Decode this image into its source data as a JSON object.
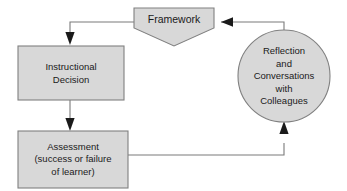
{
  "diagram": {
    "type": "flowchart-cycle",
    "canvas": {
      "width": 347,
      "height": 191
    },
    "style": {
      "node_fill": "#d8d8d8",
      "node_stroke": "#808080",
      "connector_stroke": "#7a7a7a",
      "text_color": "#1a1a1a",
      "background": "#ffffff"
    },
    "nodes": [
      {
        "id": "framework",
        "shape": "pentagon-banner",
        "lines": [
          "Framework"
        ],
        "x": 134,
        "y": 8,
        "width": 80,
        "height": 38
      },
      {
        "id": "instructional-decision",
        "shape": "rectangle",
        "lines": [
          "Instructional",
          "Decision"
        ],
        "x": 18,
        "y": 46,
        "width": 106,
        "height": 54
      },
      {
        "id": "assessment",
        "shape": "rectangle",
        "lines": [
          "Assessment",
          "(success or failure",
          "of learner)"
        ],
        "x": 18,
        "y": 131,
        "width": 110,
        "height": 57
      },
      {
        "id": "reflection",
        "shape": "circle",
        "lines": [
          "Reflection",
          "and",
          "Conversations",
          "with",
          "Colleagues"
        ],
        "cx": 284,
        "cy": 76,
        "r": 46
      }
    ],
    "connectors": [
      {
        "id": "framework-to-instructional-decision",
        "from": "framework",
        "to": "instructional-decision",
        "arrow": "down"
      },
      {
        "id": "instructional-decision-to-assessment",
        "from": "instructional-decision",
        "to": "assessment",
        "arrow": "down"
      },
      {
        "id": "assessment-to-reflection",
        "from": "assessment",
        "to": "reflection",
        "arrow": "up"
      },
      {
        "id": "reflection-to-framework",
        "from": "reflection",
        "to": "framework",
        "arrow": "left"
      }
    ]
  }
}
